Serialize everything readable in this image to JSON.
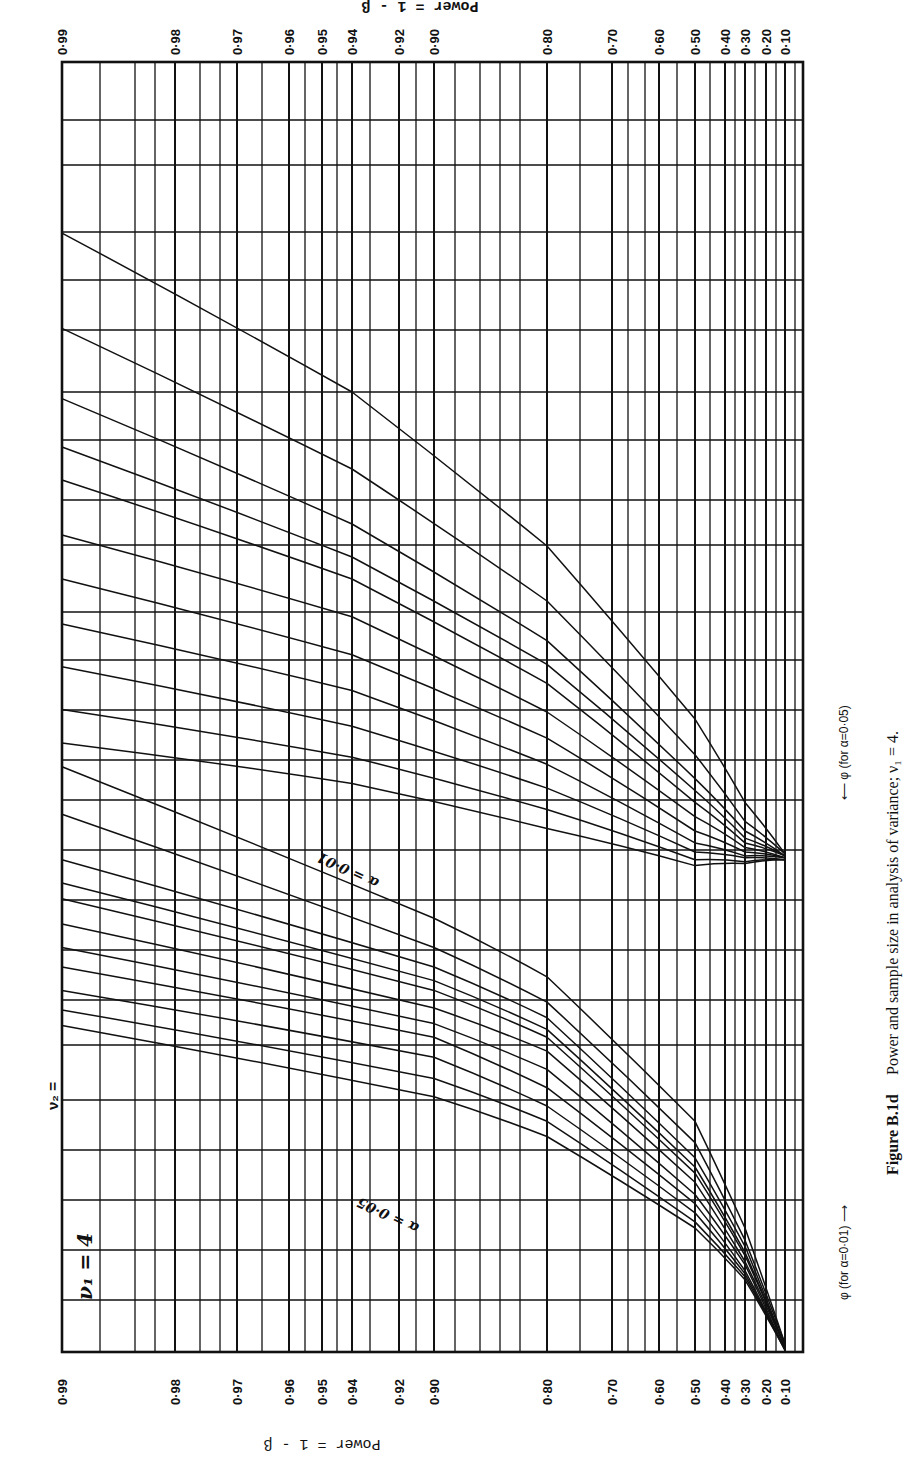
{
  "figure": {
    "caption_label": "Figure B.1d",
    "caption_text": "Power and sample size in analysis of variance; ν₁ = 4.",
    "nu1_label": "ν₁ = 4",
    "nu2_prefix": "ν₂ =",
    "header_fragment": "Power = 1 - β",
    "axis_title": "Power = 1 - β",
    "phi_label_alpha01": "φ (for α=0·01) ⟶",
    "phi_label_alpha05": "⟵ φ (for α=0·05)",
    "alpha01_tag": "α = 0·01",
    "alpha05_tag": "α = 0·05"
  },
  "chart_data": {
    "type": "line",
    "xlabel": "φ",
    "ylabel": "Power = 1 - β",
    "orientation_note": "Figure printed rotated 90°: power runs along the long edge, φ along the short edge",
    "power_ticks": [
      "0·99",
      "0·98",
      "0·97",
      "0·96",
      "0·95",
      "0·94",
      "0·92",
      "0·90",
      "0·80",
      "0·70",
      "0·60",
      "0·50",
      "0·40",
      "0·30",
      "0·20",
      "0·10"
    ],
    "phi_ticks_alpha_0_01": [
      "1",
      "2",
      "3",
      "4",
      "5"
    ],
    "phi_ticks_alpha_0_05": [
      "1",
      "2",
      "3"
    ],
    "nu2_values": [
      "6",
      "7",
      "8",
      "9",
      "10",
      "12",
      "15",
      "20",
      "30",
      "60",
      "∞"
    ],
    "grid": true,
    "series": [
      {
        "name": "α=0.01, ν2=6",
        "alpha": 0.01,
        "nu2": "6",
        "points": [
          [
            0.99,
            4.7
          ],
          [
            0.94,
            4.0
          ],
          [
            0.8,
            3.3
          ],
          [
            0.5,
            2.55
          ],
          [
            0.3,
            2.2
          ],
          [
            0.1,
            1.98
          ]
        ]
      },
      {
        "name": "α=0.01, ν2=7",
        "alpha": 0.01,
        "nu2": "7",
        "points": [
          [
            0.99,
            4.28
          ],
          [
            0.94,
            3.65
          ],
          [
            0.8,
            3.05
          ],
          [
            0.5,
            2.4
          ],
          [
            0.3,
            2.12
          ],
          [
            0.1,
            1.98
          ]
        ]
      },
      {
        "name": "α=0.01, ν2=8",
        "alpha": 0.01,
        "nu2": "8",
        "points": [
          [
            0.99,
            3.97
          ],
          [
            0.94,
            3.4
          ],
          [
            0.8,
            2.88
          ],
          [
            0.5,
            2.3
          ],
          [
            0.3,
            2.08
          ],
          [
            0.1,
            1.97
          ]
        ]
      },
      {
        "name": "α=0.01, ν2=9",
        "alpha": 0.01,
        "nu2": "9",
        "points": [
          [
            0.99,
            3.75
          ],
          [
            0.94,
            3.25
          ],
          [
            0.8,
            2.78
          ],
          [
            0.5,
            2.25
          ],
          [
            0.3,
            2.05
          ],
          [
            0.1,
            1.97
          ]
        ]
      },
      {
        "name": "α=0.01, ν2=10",
        "alpha": 0.01,
        "nu2": "10",
        "points": [
          [
            0.99,
            3.6
          ],
          [
            0.94,
            3.15
          ],
          [
            0.8,
            2.7
          ],
          [
            0.5,
            2.2
          ],
          [
            0.3,
            2.03
          ],
          [
            0.1,
            1.97
          ]
        ]
      },
      {
        "name": "α=0.01, ν2=12",
        "alpha": 0.01,
        "nu2": "12",
        "points": [
          [
            0.99,
            3.35
          ],
          [
            0.94,
            2.98
          ],
          [
            0.8,
            2.58
          ],
          [
            0.5,
            2.14
          ],
          [
            0.3,
            2.01
          ],
          [
            0.1,
            1.96
          ]
        ]
      },
      {
        "name": "α=0.01, ν2=15",
        "alpha": 0.01,
        "nu2": "15",
        "points": [
          [
            0.99,
            3.15
          ],
          [
            0.94,
            2.82
          ],
          [
            0.8,
            2.47
          ],
          [
            0.5,
            2.08
          ],
          [
            0.3,
            1.99
          ],
          [
            0.1,
            1.96
          ]
        ]
      },
      {
        "name": "α=0.01, ν2=20",
        "alpha": 0.01,
        "nu2": "20",
        "points": [
          [
            0.99,
            2.95
          ],
          [
            0.94,
            2.67
          ],
          [
            0.8,
            2.36
          ],
          [
            0.5,
            2.03
          ],
          [
            0.3,
            1.97
          ],
          [
            0.1,
            1.96
          ]
        ]
      },
      {
        "name": "α=0.01, ν2=30",
        "alpha": 0.01,
        "nu2": "30",
        "points": [
          [
            0.99,
            2.77
          ],
          [
            0.94,
            2.52
          ],
          [
            0.8,
            2.26
          ],
          [
            0.5,
            1.99
          ],
          [
            0.3,
            1.96
          ],
          [
            0.1,
            1.95
          ]
        ]
      },
      {
        "name": "α=0.01, ν2=60",
        "alpha": 0.01,
        "nu2": "60",
        "points": [
          [
            0.99,
            2.59
          ],
          [
            0.94,
            2.39
          ],
          [
            0.8,
            2.17
          ],
          [
            0.5,
            1.95
          ],
          [
            0.3,
            1.94
          ],
          [
            0.1,
            1.95
          ]
        ]
      },
      {
        "name": "α=0.01, ν2=∞",
        "alpha": 0.01,
        "nu2": "∞",
        "points": [
          [
            0.99,
            2.45
          ],
          [
            0.94,
            2.28
          ],
          [
            0.8,
            2.09
          ],
          [
            0.5,
            1.92
          ],
          [
            0.3,
            1.93
          ],
          [
            0.1,
            1.95
          ]
        ]
      },
      {
        "name": "α=0.05, ν2=6",
        "alpha": 0.05,
        "nu2": "6",
        "points": [
          [
            0.99,
            3.35
          ],
          [
            0.9,
            2.65
          ],
          [
            0.8,
            2.35
          ],
          [
            0.5,
            1.75
          ],
          [
            0.3,
            1.4
          ],
          [
            0.1,
            1.02
          ]
        ]
      },
      {
        "name": "α=0.05, ν2=7",
        "alpha": 0.05,
        "nu2": "7",
        "points": [
          [
            0.99,
            3.15
          ],
          [
            0.9,
            2.5
          ],
          [
            0.8,
            2.22
          ],
          [
            0.5,
            1.68
          ],
          [
            0.3,
            1.36
          ],
          [
            0.1,
            1.02
          ]
        ]
      },
      {
        "name": "α=0.05, ν2=8",
        "alpha": 0.05,
        "nu2": "8",
        "points": [
          [
            0.99,
            2.95
          ],
          [
            0.9,
            2.4
          ],
          [
            0.8,
            2.14
          ],
          [
            0.5,
            1.63
          ],
          [
            0.3,
            1.34
          ],
          [
            0.1,
            1.01
          ]
        ]
      },
      {
        "name": "α=0.05, ν2=9",
        "alpha": 0.05,
        "nu2": "9",
        "points": [
          [
            0.99,
            2.83
          ],
          [
            0.9,
            2.33
          ],
          [
            0.8,
            2.08
          ],
          [
            0.5,
            1.6
          ],
          [
            0.3,
            1.32
          ],
          [
            0.1,
            1.01
          ]
        ]
      },
      {
        "name": "α=0.05, ν2=10",
        "alpha": 0.05,
        "nu2": "10",
        "points": [
          [
            0.99,
            2.75
          ],
          [
            0.9,
            2.28
          ],
          [
            0.8,
            2.04
          ],
          [
            0.5,
            1.58
          ],
          [
            0.3,
            1.31
          ],
          [
            0.1,
            1.01
          ]
        ]
      },
      {
        "name": "α=0.05, ν2=12",
        "alpha": 0.05,
        "nu2": "12",
        "points": [
          [
            0.99,
            2.62
          ],
          [
            0.9,
            2.19
          ],
          [
            0.8,
            1.98
          ],
          [
            0.5,
            1.55
          ],
          [
            0.3,
            1.29
          ],
          [
            0.1,
            1.01
          ]
        ]
      },
      {
        "name": "α=0.05, ν2=15",
        "alpha": 0.05,
        "nu2": "15",
        "points": [
          [
            0.99,
            2.5
          ],
          [
            0.9,
            2.11
          ],
          [
            0.8,
            1.92
          ],
          [
            0.5,
            1.51
          ],
          [
            0.3,
            1.28
          ],
          [
            0.1,
            1.0
          ]
        ]
      },
      {
        "name": "α=0.05, ν2=20",
        "alpha": 0.05,
        "nu2": "20",
        "points": [
          [
            0.99,
            2.4
          ],
          [
            0.9,
            2.04
          ],
          [
            0.8,
            1.86
          ],
          [
            0.5,
            1.48
          ],
          [
            0.3,
            1.26
          ],
          [
            0.1,
            1.0
          ]
        ]
      },
      {
        "name": "α=0.05, ν2=30",
        "alpha": 0.05,
        "nu2": "30",
        "points": [
          [
            0.99,
            2.28
          ],
          [
            0.9,
            1.96
          ],
          [
            0.8,
            1.8
          ],
          [
            0.5,
            1.45
          ],
          [
            0.3,
            1.25
          ],
          [
            0.1,
            1.0
          ]
        ]
      },
      {
        "name": "α=0.05, ν2=60",
        "alpha": 0.05,
        "nu2": "60",
        "points": [
          [
            0.99,
            2.18
          ],
          [
            0.9,
            1.89
          ],
          [
            0.8,
            1.75
          ],
          [
            0.5,
            1.42
          ],
          [
            0.3,
            1.24
          ],
          [
            0.1,
            1.0
          ]
        ]
      },
      {
        "name": "α=0.05, ν2=∞",
        "alpha": 0.05,
        "nu2": "∞",
        "points": [
          [
            0.99,
            2.1
          ],
          [
            0.9,
            1.83
          ],
          [
            0.8,
            1.7
          ],
          [
            0.5,
            1.4
          ],
          [
            0.3,
            1.23
          ],
          [
            0.1,
            1.0
          ]
        ]
      }
    ]
  },
  "layout": {
    "power_x": {
      "0.99": 62,
      "0.98": 175,
      "0.97": 237,
      "0.96": 289,
      "0.95": 322,
      "0.94": 352,
      "0.92": 399,
      "0.90": 434,
      "0.80": 547,
      "0.70": 612,
      "0.60": 659,
      "0.50": 695,
      "0.40": 725,
      "0.30": 745,
      "0.20": 766,
      "0.10": 785
    },
    "frame": {
      "left": 62,
      "right": 803,
      "top": 62,
      "bottom": 1352
    },
    "phi01_y": {
      "1": 1045,
      "2": 850,
      "3": 612,
      "4": 392,
      "5": 165,
      "5.5": 62
    },
    "phi05_y": {
      "1": 1350,
      "2": 1045,
      "3": 850,
      "4": 612
    },
    "hlines": [
      62,
      120,
      165,
      232,
      280,
      330,
      392,
      440,
      500,
      545,
      612,
      660,
      710,
      760,
      800,
      850,
      900,
      950,
      1000,
      1045,
      1100,
      1150,
      1200,
      1250,
      1300,
      1352
    ],
    "extra_vlines": [
      100,
      135,
      155,
      200,
      220,
      262,
      305,
      337,
      370,
      416,
      455,
      480,
      500,
      520,
      580,
      628,
      645,
      677,
      710,
      735,
      755,
      776,
      795
    ]
  },
  "labels": {
    "alpha01_mid1": {
      "x": 330,
      "items": [
        [
          "20",
          645
        ],
        [
          "30",
          690
        ],
        [
          "60",
          728
        ],
        [
          "∞",
          760
        ]
      ]
    },
    "alpha01_mid0": {
      "x": 355,
      "items": [
        [
          "6",
          395
        ],
        [
          "7",
          460
        ],
        [
          "8",
          520
        ],
        [
          "9",
          562
        ],
        [
          "10",
          598
        ],
        [
          "12",
          638
        ]
      ]
    },
    "alpha01_mid2": {
      "x": 612,
      "items": [
        [
          "6",
          735
        ],
        [
          "7",
          782
        ],
        [
          "8",
          812
        ],
        [
          "10 9",
          847
        ],
        [
          "12",
          880
        ],
        [
          "15",
          903
        ],
        [
          "20",
          932
        ],
        [
          "30",
          957
        ],
        [
          "60",
          978
        ],
        [
          "∞",
          1000
        ]
      ]
    },
    "alpha05_mid": {
      "x": 462,
      "items": [
        [
          "6",
          985
        ],
        [
          "7",
          1015
        ],
        [
          "10 9 8",
          1052
        ],
        [
          "15",
          1092
        ],
        [
          "30",
          1130
        ],
        [
          "∞",
          1160
        ]
      ]
    },
    "left_nu2_alpha01": [
      [
        "6",
        232
      ],
      [
        "7",
        330
      ],
      [
        "8",
        404
      ],
      [
        "9",
        455
      ],
      [
        "10",
        490
      ],
      [
        "12",
        545
      ],
      [
        "15",
        595
      ],
      [
        "20",
        645
      ],
      [
        "30",
        690
      ],
      [
        "60",
        728
      ],
      [
        "∞",
        760
      ]
    ],
    "left_nu2_alpha05": [
      [
        "6",
        785
      ],
      [
        "7",
        828
      ],
      [
        "8",
        870
      ],
      [
        "9",
        900
      ],
      [
        "10",
        917
      ],
      [
        "12",
        945
      ],
      [
        "15",
        975
      ],
      [
        "20",
        997
      ],
      [
        "30",
        1020
      ],
      [
        "60",
        1040
      ],
      [
        "∞",
        1060
      ]
    ]
  }
}
